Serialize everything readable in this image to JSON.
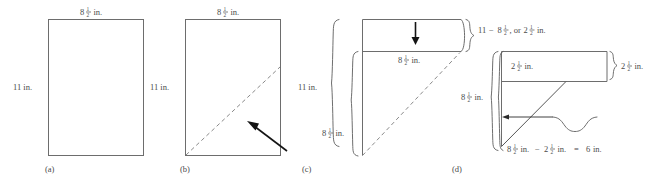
{
  "figure": {
    "panels": [
      {
        "id": "a",
        "label": "(a)",
        "description": "Plain sheet of paper",
        "annotations": [
          {
            "name": "width-label",
            "text": "8½ in.",
            "whole": "8",
            "num": "1",
            "den": "2",
            "unit": "in."
          },
          {
            "name": "height-label",
            "text": "11 in.",
            "whole": "11",
            "num": "",
            "den": "",
            "unit": "in."
          }
        ]
      },
      {
        "id": "b",
        "label": "(b)",
        "description": "Sheet with dashed diagonal fold line and pointing arrow",
        "annotations": [
          {
            "name": "width-label",
            "text": "8½ in.",
            "whole": "8",
            "num": "1",
            "den": "2",
            "unit": "in."
          },
          {
            "name": "height-label",
            "text": "11 in.",
            "whole": "11",
            "num": "",
            "den": "",
            "unit": "in."
          }
        ]
      },
      {
        "id": "c",
        "label": "(c)",
        "description": "Paper folded along the diagonal, leaving a rectangular strip at the top",
        "annotations": [
          {
            "name": "total-height-brace-label",
            "text": "11 in.",
            "whole": "11",
            "num": "",
            "den": "",
            "unit": "in."
          },
          {
            "name": "folded-height-brace-label",
            "text": "8½ in.",
            "whole": "8",
            "num": "1",
            "den": "2",
            "unit": "in."
          },
          {
            "name": "strip-width-label",
            "text": "8½ in.",
            "whole": "8",
            "num": "1",
            "den": "2",
            "unit": "in."
          },
          {
            "name": "strip-height-brace-label",
            "text": "11 − 8½, or 2½ in.",
            "unit": "in."
          }
        ]
      },
      {
        "id": "d",
        "label": "(d)",
        "description": "Strip folded over; remaining length computed",
        "annotations": [
          {
            "name": "strip-height-label",
            "text": "2½ in.",
            "whole": "2",
            "num": "1",
            "den": "2",
            "unit": "in."
          },
          {
            "name": "strip-height-right-brace-label",
            "text": "2½ in.",
            "whole": "2",
            "num": "1",
            "den": "2",
            "unit": "in."
          },
          {
            "name": "side-length-brace-label",
            "text": "8½ in.",
            "whole": "8",
            "num": "1",
            "den": "2",
            "unit": "in."
          },
          {
            "name": "remainder-equation-label",
            "text": "8½ in. − 2½ in.  =  6 in.",
            "unit": "in."
          }
        ]
      }
    ],
    "expressions": {
      "c_strip_height": {
        "left_whole": "11",
        "minus": "−",
        "sub_whole": "8",
        "sub_num": "1",
        "sub_den": "2",
        "comma_or": ", or",
        "result_whole": "2",
        "result_num": "1",
        "result_den": "2",
        "unit": "in."
      },
      "d_remainder": {
        "a_whole": "8",
        "a_num": "1",
        "a_den": "2",
        "a_unit": "in.",
        "minus": "−",
        "b_whole": "2",
        "b_num": "1",
        "b_den": "2",
        "b_unit": "in.",
        "equals": "=",
        "result": "6",
        "result_unit": "in."
      }
    },
    "colors": {
      "outline": "#6d6d6d",
      "dashed": "#8a8a8a",
      "brace": "#5e5e5e",
      "arrow": "#141414",
      "text": "#4a4a4a",
      "background": "#ffffff"
    }
  }
}
